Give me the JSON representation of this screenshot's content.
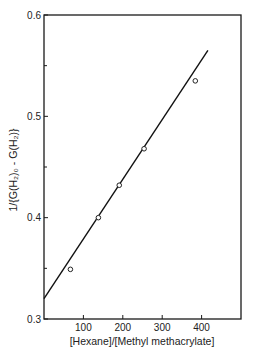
{
  "chart_data": {
    "type": "scatter",
    "title": "",
    "xlabel": "[Hexane]/[Methyl methacrylate]",
    "ylabel": "1/{G(H₂)₀ - G(H₂)}",
    "xlim": [
      0,
      500
    ],
    "ylim": [
      0.3,
      0.6
    ],
    "x_ticks": [
      100,
      200,
      300,
      400
    ],
    "x_tick_labels": [
      "100",
      "200",
      "300",
      "400"
    ],
    "y_ticks": [
      0.3,
      0.4,
      0.5,
      0.6
    ],
    "y_tick_labels": [
      "0.3",
      "0.4",
      "0.5",
      "0.6"
    ],
    "y_minor_ticks": [
      0.35,
      0.45,
      0.55
    ],
    "grid": false,
    "legend": "none",
    "series": [
      {
        "name": "measured",
        "marker": "open-circle",
        "x": [
          67,
          138,
          191,
          254,
          384
        ],
        "y": [
          0.349,
          0.4,
          0.432,
          0.468,
          0.535
        ]
      }
    ],
    "fit_line": {
      "x": [
        0,
        416
      ],
      "y": [
        0.32,
        0.565
      ]
    }
  }
}
